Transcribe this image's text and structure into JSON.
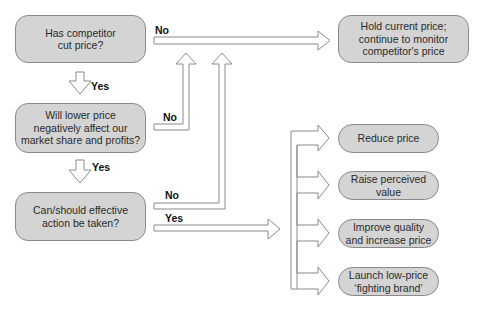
{
  "diagram": {
    "type": "flowchart",
    "decisions": [
      {
        "id": "q1",
        "text": "Has competitor\ncut price?"
      },
      {
        "id": "q2",
        "text": "Will lower price\nnegatively affect our\nmarket share and profits?"
      },
      {
        "id": "q3",
        "text": "Can/should effective\naction be taken?"
      }
    ],
    "outcome_hold": {
      "text": "Hold current price;\ncontinue to monitor\ncompetitor's price"
    },
    "actions": [
      {
        "text": "Reduce price"
      },
      {
        "text": "Raise perceived\nvalue"
      },
      {
        "text": "Improve quality\nand increase price"
      },
      {
        "text": "Launch low-price\n‘fighting brand’"
      }
    ],
    "edge_labels": {
      "q1_no": "No",
      "q1_yes": "Yes",
      "q2_no": "No",
      "q2_yes": "Yes",
      "q3_no": "No",
      "q3_yes": "Yes"
    },
    "colors": {
      "box_fill": "#d4d4d4",
      "box_border": "#8a8a8a",
      "arrow_fill": "#ffffff",
      "arrow_stroke": "#8a8a8a",
      "text": "#2a2a2a"
    }
  }
}
